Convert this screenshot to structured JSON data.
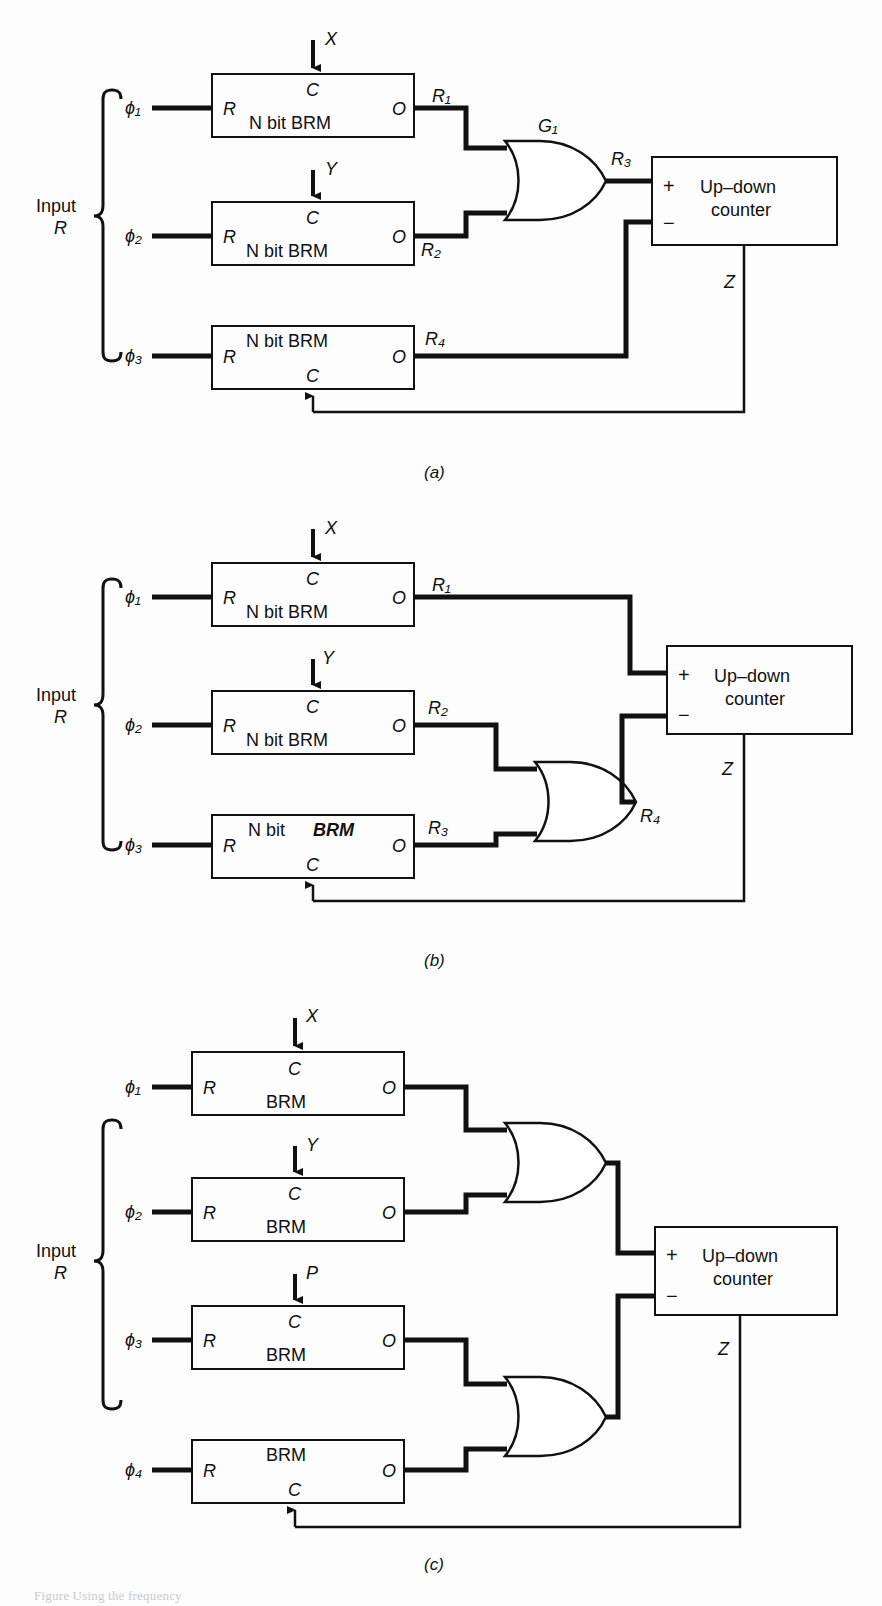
{
  "figure": {
    "background_color": "#fdfdfd",
    "line_color": "#111111",
    "partial_caption": "Figure  Using the frequency"
  },
  "common": {
    "input_label_line1": "Input",
    "input_label_line2": "R",
    "brm_reset_port": "R",
    "brm_clock_port": "C",
    "brm_out_port": "O",
    "counter_title_line1": "Up–down",
    "counter_title_line2": "counter",
    "counter_plus": "+",
    "counter_minus": "−",
    "counter_output": "Z"
  },
  "panels": [
    {
      "id": "a",
      "caption": "(a)",
      "phases": [
        "ϕ₁",
        "ϕ₂",
        "ϕ₃"
      ],
      "blocks": [
        {
          "body": "N bit BRM",
          "clock_input": "X",
          "clock_side": "top",
          "output": "R₁"
        },
        {
          "body": "N bit  BRM",
          "clock_input": "Y",
          "clock_side": "top",
          "output": "R₂"
        },
        {
          "body": "N bit  BRM",
          "clock_input": "Z",
          "clock_side": "bottom",
          "output": "R₄"
        }
      ],
      "gates": [
        {
          "name": "G₁",
          "type": "or",
          "inputs": [
            "R₁",
            "R₂"
          ],
          "output": "R₃"
        }
      ],
      "counter": {
        "plus_input": "R₃",
        "minus_input": "R₄",
        "output": "Z"
      }
    },
    {
      "id": "b",
      "caption": "(b)",
      "phases": [
        "ϕ₁",
        "ϕ₂",
        "ϕ₃"
      ],
      "blocks": [
        {
          "body": "N bit  BRM",
          "clock_input": "X",
          "clock_side": "top",
          "output": "R₁"
        },
        {
          "body": "N bit  BRM",
          "clock_input": "Y",
          "clock_side": "top",
          "output": "R₂"
        },
        {
          "body_plain": "N bit",
          "body_bold": "BRM",
          "clock_input": "Z",
          "clock_side": "bottom",
          "output": "R₃"
        }
      ],
      "gates": [
        {
          "name": "",
          "type": "or",
          "inputs": [
            "R₂",
            "R₃"
          ],
          "output": "R₄"
        }
      ],
      "counter": {
        "plus_input": "R₁",
        "minus_input": "R₄",
        "output": "Z"
      }
    },
    {
      "id": "c",
      "caption": "(c)",
      "phases": [
        "ϕ₁",
        "ϕ₂",
        "ϕ₃",
        "ϕ₄"
      ],
      "blocks": [
        {
          "body": "BRM",
          "clock_input": "X",
          "clock_side": "top",
          "output": ""
        },
        {
          "body": "BRM",
          "clock_input": "Y",
          "clock_side": "top",
          "output": ""
        },
        {
          "body": "BRM",
          "clock_input": "P",
          "clock_side": "top",
          "output": ""
        },
        {
          "body": "BRM",
          "clock_input": "Z",
          "clock_side": "bottom",
          "output": ""
        }
      ],
      "gates": [
        {
          "name": "",
          "type": "or",
          "inputs": [
            "",
            ""
          ],
          "output": ""
        },
        {
          "name": "",
          "type": "or",
          "inputs": [
            "",
            ""
          ],
          "output": ""
        }
      ],
      "counter": {
        "plus_input": "",
        "minus_input": "",
        "output": "Z"
      }
    }
  ]
}
